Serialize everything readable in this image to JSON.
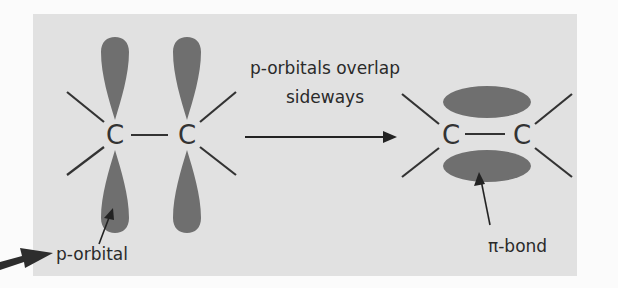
{
  "figure": {
    "background_color": "#e1e1e1",
    "orbital_color": "#6f6f6f",
    "line_color": "#333333"
  },
  "left_molecule": {
    "atoms": [
      "C",
      "C"
    ],
    "label": "p-orbital"
  },
  "transition": {
    "caption_line1": "p-orbitals overlap",
    "caption_line2": "sideways",
    "arrow": "right-arrow"
  },
  "right_molecule": {
    "atoms": [
      "C",
      "C"
    ],
    "label": "π-bond"
  },
  "pointer": {
    "icon": "bold-pointer-arrow"
  }
}
